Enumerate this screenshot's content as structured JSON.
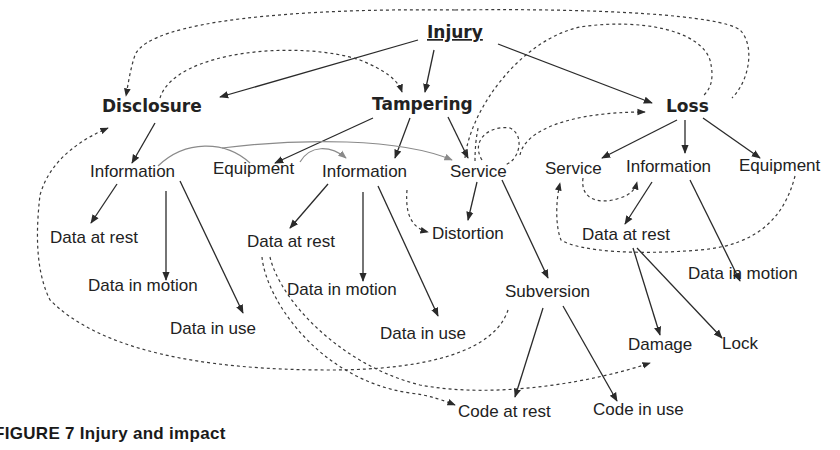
{
  "figure": {
    "caption": "FIGURE 7 Injury and impact"
  },
  "nodes": {
    "injury": "Injury",
    "disclosure": "Disclosure",
    "tampering": "Tampering",
    "loss": "Loss",
    "disclosure_information": "Information",
    "disclosure_data_at_rest": "Data at rest",
    "disclosure_data_in_motion": "Data in motion",
    "disclosure_data_in_use": "Data in use",
    "tampering_equipment": "Equipment",
    "tampering_information": "Information",
    "tampering_service": "Service",
    "tampering_data_at_rest": "Data at rest",
    "tampering_data_in_motion": "Data in motion",
    "tampering_data_in_use": "Data in use",
    "distortion": "Distortion",
    "subversion": "Subversion",
    "code_at_rest": "Code at rest",
    "code_in_use": "Code in use",
    "loss_service": "Service",
    "loss_information": "Information",
    "loss_equipment": "Equipment",
    "loss_data_at_rest": "Data at rest",
    "loss_data_in_motion": "Data in motion",
    "damage": "Damage",
    "lock": "Lock"
  }
}
